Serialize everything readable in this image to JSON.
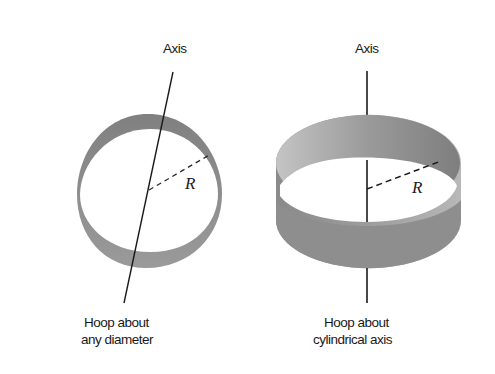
{
  "figure": {
    "left_panel": {
      "axis_label": "Axis",
      "radius_label": "R",
      "caption_line1": "Hoop about",
      "caption_line2": "any diameter"
    },
    "right_panel": {
      "axis_label": "Axis",
      "radius_label": "R",
      "caption_line1": "Hoop about",
      "caption_line2": "cylindrical axis"
    },
    "colors": {
      "hoop_fill": "#8c8c8c",
      "hoop_light": "#b4b4b4",
      "line": "#1a1a1a",
      "background": "#ffffff"
    }
  }
}
